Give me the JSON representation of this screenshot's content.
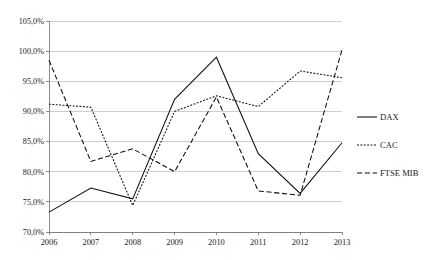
{
  "chart_data": {
    "type": "line",
    "title": "",
    "xlabel": "",
    "ylabel": "",
    "categories": [
      "2006",
      "2007",
      "2008",
      "2009",
      "2010",
      "2011",
      "2012",
      "2013"
    ],
    "x": [
      2006,
      2007,
      2008,
      2009,
      2010,
      2011,
      2012,
      2013
    ],
    "ylim": [
      70.0,
      105.0
    ],
    "ytick_labels": [
      "70,0%",
      "75,0%",
      "80,0%",
      "85,0%",
      "90,0%",
      "95,0%",
      "100,0%",
      "105,0%"
    ],
    "ytick_values": [
      70.0,
      75.0,
      80.0,
      85.0,
      90.0,
      95.0,
      100.0,
      105.0
    ],
    "grid": true,
    "legend_position": "right",
    "value_suffix": "%",
    "decimal_separator": ",",
    "series": [
      {
        "name": "DAX",
        "style": "solid",
        "values": [
          73.3,
          77.3,
          75.5,
          92.0,
          99.0,
          83.0,
          76.4,
          84.8
        ]
      },
      {
        "name": "CAC",
        "style": "dotted",
        "values": [
          91.2,
          90.7,
          74.4,
          90.0,
          92.6,
          90.8,
          96.7,
          95.6
        ]
      },
      {
        "name": "FTSE MIB",
        "style": "dashed",
        "values": [
          98.5,
          81.7,
          83.8,
          80.0,
          92.4,
          76.8,
          76.1,
          100.2
        ]
      }
    ]
  },
  "legend": {
    "items": [
      {
        "label": "DAX"
      },
      {
        "label": "CAC"
      },
      {
        "label": "FTSE MIB"
      }
    ]
  }
}
